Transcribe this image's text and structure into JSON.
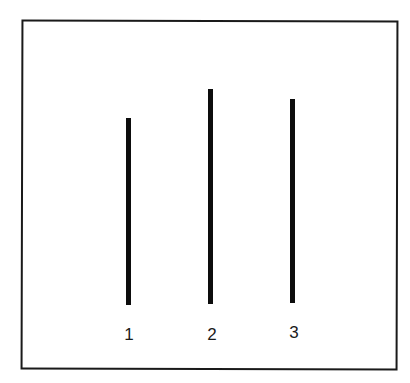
{
  "diagram": {
    "frame": {
      "color": "#1a1a1a"
    },
    "lines": [
      {
        "id": "1",
        "label": "1",
        "x": 126,
        "top": 118,
        "bottom": 305,
        "color": "#0d0d0d"
      },
      {
        "id": "2",
        "label": "2",
        "x": 208,
        "top": 89,
        "bottom": 304,
        "color": "#0d0d0d"
      },
      {
        "id": "3",
        "label": "3",
        "x": 290,
        "top": 99,
        "bottom": 303,
        "color": "#0d0d0d"
      }
    ]
  }
}
